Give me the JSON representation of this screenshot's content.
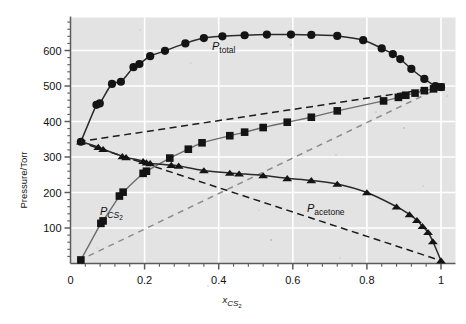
{
  "figure": {
    "background_color": "#ffffff",
    "plot_background_color": "#e3e3e3",
    "grid_color": "#ffffff",
    "axis_color": "#5b5b5b",
    "data_color": "#141414"
  },
  "axes": {
    "y_title": "Pressure/Torr",
    "x_title_main": "x",
    "x_title_sub": "CS",
    "x_title_sub2": "2",
    "y_ticks": [
      "100",
      "200",
      "300",
      "400",
      "500",
      "600"
    ],
    "x_ticks": [
      "0",
      "0.2",
      "0.4",
      "0.6",
      "0.8",
      "1"
    ]
  },
  "labels": {
    "total": {
      "p": "P",
      "sub": "total"
    },
    "cs2": {
      "p": "P",
      "sub": "CS",
      "sub2": "2"
    },
    "acetone": {
      "p": "P",
      "sub": "acetone"
    }
  },
  "chart_data": {
    "type": "scatter",
    "title": "",
    "subtitle": "",
    "xlabel": "x_CS2",
    "ylabel": "Pressure/Torr",
    "xlim": [
      0,
      1
    ],
    "ylim": [
      0,
      693
    ],
    "grid": true,
    "legend_position": "inline-annotations",
    "x_tick_values": [
      0,
      0.2,
      0.4,
      0.6,
      0.8,
      1
    ],
    "y_tick_values": [
      100,
      200,
      300,
      400,
      500,
      600
    ],
    "x_minor_tick_step": 0.04,
    "y_minor_tick_step": 20,
    "annotations": [
      {
        "text": "P_total",
        "x": 0.38,
        "y": 645
      },
      {
        "text": "P_CS2",
        "x": 0.105,
        "y": 140
      },
      {
        "text": "P_acetone",
        "x": 0.645,
        "y": 150
      }
    ],
    "series": [
      {
        "name": "P_total",
        "marker": "circle",
        "line": "solid",
        "points": [
          [
            0.028,
            343
          ],
          [
            0.07,
            447
          ],
          [
            0.079,
            451
          ],
          [
            0.112,
            506
          ],
          [
            0.136,
            512
          ],
          [
            0.17,
            553
          ],
          [
            0.186,
            562
          ],
          [
            0.215,
            584
          ],
          [
            0.255,
            599
          ],
          [
            0.31,
            620
          ],
          [
            0.36,
            635
          ],
          [
            0.41,
            640
          ],
          [
            0.47,
            643
          ],
          [
            0.53,
            645
          ],
          [
            0.595,
            645
          ],
          [
            0.65,
            644
          ],
          [
            0.72,
            641
          ],
          [
            0.79,
            629
          ],
          [
            0.84,
            606
          ],
          [
            0.87,
            590
          ],
          [
            0.89,
            576
          ],
          [
            0.92,
            548
          ],
          [
            0.955,
            520
          ],
          [
            0.985,
            500
          ],
          [
            1.0,
            497
          ]
        ]
      },
      {
        "name": "P_CS2",
        "marker": "square",
        "line": "solid",
        "points": [
          [
            0.028,
            10
          ],
          [
            0.082,
            113
          ],
          [
            0.088,
            120
          ],
          [
            0.132,
            190
          ],
          [
            0.142,
            201
          ],
          [
            0.196,
            254
          ],
          [
            0.205,
            260
          ],
          [
            0.268,
            297
          ],
          [
            0.318,
            322
          ],
          [
            0.355,
            340
          ],
          [
            0.43,
            360
          ],
          [
            0.47,
            370
          ],
          [
            0.52,
            383
          ],
          [
            0.585,
            398
          ],
          [
            0.65,
            412
          ],
          [
            0.72,
            430
          ],
          [
            0.845,
            458
          ],
          [
            0.885,
            468
          ],
          [
            0.905,
            474
          ],
          [
            0.93,
            480
          ],
          [
            0.955,
            487
          ],
          [
            0.98,
            492
          ],
          [
            1.0,
            497
          ]
        ]
      },
      {
        "name": "P_acetone",
        "marker": "triangle",
        "line": "solid",
        "points": [
          [
            0.028,
            343
          ],
          [
            0.075,
            328
          ],
          [
            0.088,
            322
          ],
          [
            0.14,
            302
          ],
          [
            0.15,
            299
          ],
          [
            0.196,
            288
          ],
          [
            0.205,
            284
          ],
          [
            0.215,
            282
          ],
          [
            0.272,
            277
          ],
          [
            0.292,
            275
          ],
          [
            0.36,
            262
          ],
          [
            0.43,
            255
          ],
          [
            0.455,
            253
          ],
          [
            0.52,
            248
          ],
          [
            0.585,
            240
          ],
          [
            0.65,
            234
          ],
          [
            0.72,
            224
          ],
          [
            0.8,
            200
          ],
          [
            0.88,
            160
          ],
          [
            0.915,
            138
          ],
          [
            0.935,
            122
          ],
          [
            0.95,
            105
          ],
          [
            0.965,
            88
          ],
          [
            0.978,
            62
          ],
          [
            1.0,
            8
          ]
        ]
      },
      {
        "name": "raoult_total",
        "marker": "none",
        "line": "dashed",
        "points": [
          [
            0.022,
            343
          ],
          [
            1.0,
            497
          ]
        ]
      },
      {
        "name": "raoult_acetone",
        "marker": "none",
        "line": "dashed",
        "points": [
          [
            0.022,
            343
          ],
          [
            1.0,
            8
          ]
        ]
      },
      {
        "name": "raoult_cs2",
        "marker": "none",
        "line": "dashed",
        "points": [
          [
            0.022,
            8
          ],
          [
            1.0,
            497
          ]
        ]
      }
    ]
  }
}
